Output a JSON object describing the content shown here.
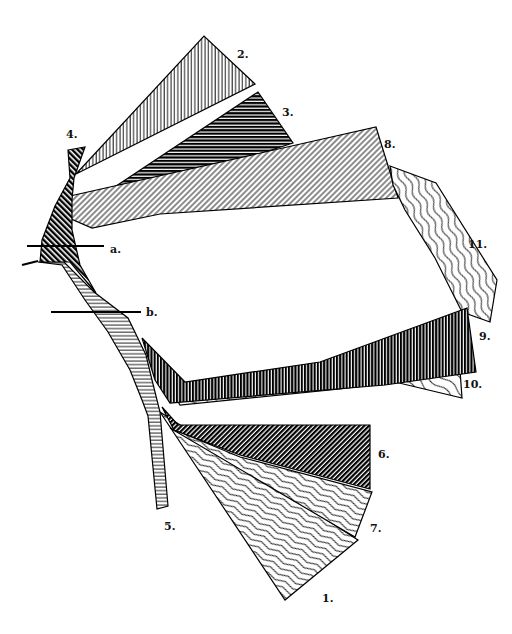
{
  "diagram": {
    "type": "hatched-fan-diagram",
    "background": "#ffffff",
    "stroke_color": "#000000",
    "bands": [
      {
        "id": "1",
        "label": "1.",
        "pattern": "wavy-lines-white",
        "points": "160,412 358,540 285,600"
      },
      {
        "id": "2",
        "label": "2.",
        "pattern": "vertical-lines-white",
        "points": "76,174 204,36 255,84"
      },
      {
        "id": "3",
        "label": "3.",
        "pattern": "horizontal-lines-dark",
        "points": "98,198 258,92 293,143 110,202"
      },
      {
        "id": "4",
        "label": "4.",
        "pattern": "diagonal-back-dark",
        "points": "68,150 85,147 74,178 72,200 72,230 80,265 96,293 70,262 40,262 42,240 55,206 70,178"
      },
      {
        "id": "5",
        "label": "5.",
        "pattern": "horizontal-lines-white",
        "points": "38,262 64,262 94,292 128,318 146,355 152,380 160,412 168,506 157,509 148,416 142,400 130,370 108,332 85,300 62,265"
      },
      {
        "id": "6",
        "label": "6.",
        "pattern": "diagonal-forward-dark",
        "points": "162,407 178,425 370,425 370,489 240,455 174,430"
      },
      {
        "id": "7",
        "label": "7.",
        "pattern": "wavy-lines-white",
        "points": "170,428 240,457 372,492 355,537"
      },
      {
        "id": "8",
        "label": "8.",
        "pattern": "diagonal-forward-white",
        "points": "70,196 376,127 398,198 160,214 92,228 69,218"
      },
      {
        "id": "9",
        "label": "9.",
        "pattern": "vertical-lines-dark",
        "points": "142,338 185,382 320,362 467,308 476,372 385,385 170,403 155,380"
      },
      {
        "id": "10",
        "label": "10.",
        "pattern": "curvy-lines-white",
        "points": "176,398 340,377 460,370 462,398 395,382 340,389 180,405"
      },
      {
        "id": "11",
        "label": "11.",
        "pattern": "wavy-vertical-white",
        "points": "390,166 436,183 497,280 490,322 462,312 435,258 405,210 393,185"
      }
    ],
    "cut_lines": [
      {
        "id": "a",
        "label": "a.",
        "x1": 27,
        "y1": 246,
        "x2": 104,
        "y2": 246
      },
      {
        "id": "b",
        "label": "b.",
        "x1": 51,
        "y1": 312,
        "x2": 141,
        "y2": 312
      }
    ],
    "stub_line": {
      "x1": 22,
      "y1": 265,
      "x2": 38,
      "y2": 261
    },
    "labels": [
      {
        "text": "1.",
        "x": 322,
        "y": 602
      },
      {
        "text": "2.",
        "x": 237,
        "y": 58
      },
      {
        "text": "3.",
        "x": 282,
        "y": 116
      },
      {
        "text": "4.",
        "x": 66,
        "y": 138
      },
      {
        "text": "5.",
        "x": 164,
        "y": 530
      },
      {
        "text": "6.",
        "x": 378,
        "y": 458
      },
      {
        "text": "7.",
        "x": 370,
        "y": 532
      },
      {
        "text": "8.",
        "x": 384,
        "y": 148
      },
      {
        "text": "9.",
        "x": 479,
        "y": 340
      },
      {
        "text": "10.",
        "x": 463,
        "y": 388
      },
      {
        "text": "11.",
        "x": 468,
        "y": 248
      },
      {
        "text": "a.",
        "x": 110,
        "y": 253
      },
      {
        "text": "b.",
        "x": 146,
        "y": 316
      }
    ]
  }
}
